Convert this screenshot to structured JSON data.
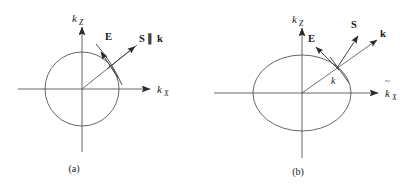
{
  "figure": {
    "background_color": "#ffffff",
    "stroke_color": "#4a4a4a",
    "text_color": "#1a1a1a",
    "panels": [
      {
        "id": "a",
        "caption": "(a)",
        "curve_type": "circle",
        "axes": {
          "vertical_label_base": "k",
          "vertical_label_sub": "Z",
          "horizontal_label_base": "k",
          "horizontal_label_sub": "X",
          "horizontal_label_tilde": false
        },
        "vectors": [
          {
            "name": "E",
            "label": "E",
            "bold": true
          },
          {
            "name": "S-parallel-k",
            "label_s": "S",
            "label_par": "∥",
            "label_k": "k",
            "bold": true
          }
        ]
      },
      {
        "id": "b",
        "caption": "(b)",
        "curve_type": "ellipse",
        "axes": {
          "vertical_label_base": "k",
          "vertical_label_sub": "Z",
          "horizontal_label_base": "k",
          "horizontal_label_sub": "X",
          "horizontal_label_tilde": true
        },
        "vectors": [
          {
            "name": "E",
            "label": "E",
            "bold": true
          },
          {
            "name": "S",
            "label": "S",
            "bold": true
          },
          {
            "name": "k",
            "label": "k",
            "bold": true
          }
        ],
        "ray_label": "k"
      }
    ]
  }
}
